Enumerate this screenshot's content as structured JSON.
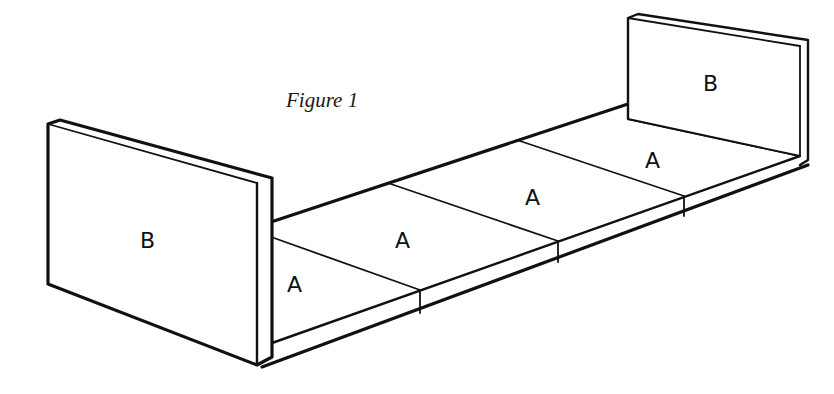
{
  "caption": "Figure 1",
  "colors": {
    "line": "#111111",
    "background": "#ffffff"
  },
  "parts": {
    "left_panel": {
      "label": "B"
    },
    "right_panel": {
      "label": "B"
    },
    "floor_panels": [
      {
        "label": "A"
      },
      {
        "label": "A"
      },
      {
        "label": "A"
      },
      {
        "label": "A"
      }
    ]
  }
}
